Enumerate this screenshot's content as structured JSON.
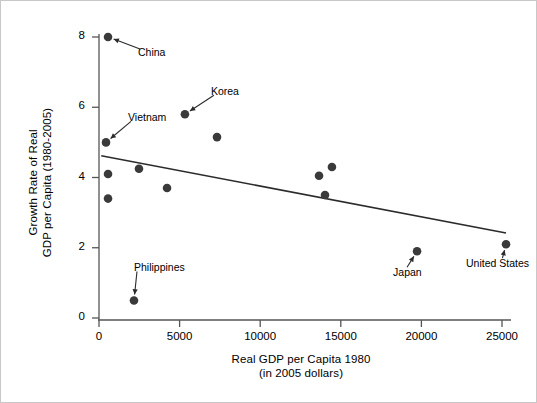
{
  "chart_data": {
    "type": "scatter",
    "title": "",
    "xlabel": "Real GDP per Capita 1980\n(in 2005 dollars)",
    "xlabel_line1": "Real GDP per Capita 1980",
    "xlabel_line2": "(in 2005 dollars)",
    "ylabel": "Growth Rate of Real\nGDP per Capita (1980-2005)",
    "ylabel_line1": "Growth Rate of Real",
    "ylabel_line2": "GDP per Capita (1980-2005)",
    "xlim": [
      0,
      26500
    ],
    "ylim": [
      -0.35,
      8.45
    ],
    "xticks": [
      0,
      5000,
      10000,
      15000,
      20000,
      25000
    ],
    "xtick_labels": [
      "0",
      "5000",
      "10000",
      "15000",
      "20000",
      "25000"
    ],
    "yticks": [
      0,
      2,
      4,
      6,
      8
    ],
    "ytick_labels": [
      "0",
      "2",
      "4",
      "6",
      "8"
    ],
    "grid": false,
    "legend": "none",
    "marker_color": "#3a3a3a",
    "line_color": "#2b2b2b",
    "axis_color": "#555555",
    "points": [
      {
        "label": "China",
        "x": 560,
        "y": 8.0,
        "labeled": true,
        "label_dx": 30,
        "label_dy": 16
      },
      {
        "label": "Korea",
        "x": 5330,
        "y": 5.8,
        "labeled": true,
        "label_dx": 26,
        "label_dy": -22
      },
      {
        "label": "Vietnam",
        "x": 435,
        "y": 5.0,
        "labeled": true,
        "label_dx": 22,
        "label_dy": -24
      },
      {
        "label": "Philippines",
        "x": 2170,
        "y": 0.5,
        "labeled": true,
        "label_dx": 0,
        "label_dy": -32
      },
      {
        "label": "Japan",
        "x": 19730,
        "y": 1.9,
        "labeled": true,
        "label_dx": -24,
        "label_dy": 22
      },
      {
        "label": "United States",
        "x": 25250,
        "y": 2.1,
        "labeled": true,
        "label_dx": -40,
        "label_dy": 20
      },
      {
        "label": "",
        "x": 560,
        "y": 4.1,
        "labeled": false,
        "label_dx": 0,
        "label_dy": 0
      },
      {
        "label": "",
        "x": 560,
        "y": 3.4,
        "labeled": false,
        "label_dx": 0,
        "label_dy": 0
      },
      {
        "label": "",
        "x": 2480,
        "y": 4.25,
        "labeled": false,
        "label_dx": 0,
        "label_dy": 0
      },
      {
        "label": "",
        "x": 4220,
        "y": 3.7,
        "labeled": false,
        "label_dx": 0,
        "label_dy": 0
      },
      {
        "label": "",
        "x": 7320,
        "y": 5.15,
        "labeled": false,
        "label_dx": 0,
        "label_dy": 0
      },
      {
        "label": "",
        "x": 13650,
        "y": 4.05,
        "labeled": false,
        "label_dx": 0,
        "label_dy": 0
      },
      {
        "label": "",
        "x": 14450,
        "y": 4.3,
        "labeled": false,
        "label_dx": 0,
        "label_dy": 0
      },
      {
        "label": "",
        "x": 14020,
        "y": 3.5,
        "labeled": false,
        "label_dx": 0,
        "label_dy": 0
      }
    ],
    "fit_line": {
      "type": "linear",
      "x_start": 140,
      "y_start": 4.62,
      "x_end": 25250,
      "y_end": 2.42
    },
    "annotations": [
      {
        "text": "China",
        "arrow_to_point": 0
      },
      {
        "text": "Korea",
        "arrow_to_point": 1
      },
      {
        "text": "Vietnam",
        "arrow_to_point": 2
      },
      {
        "text": "Philippines",
        "arrow_to_point": 3
      },
      {
        "text": "Japan",
        "arrow_to_point": 4
      },
      {
        "text": "United States",
        "arrow_to_point": 5
      }
    ]
  }
}
